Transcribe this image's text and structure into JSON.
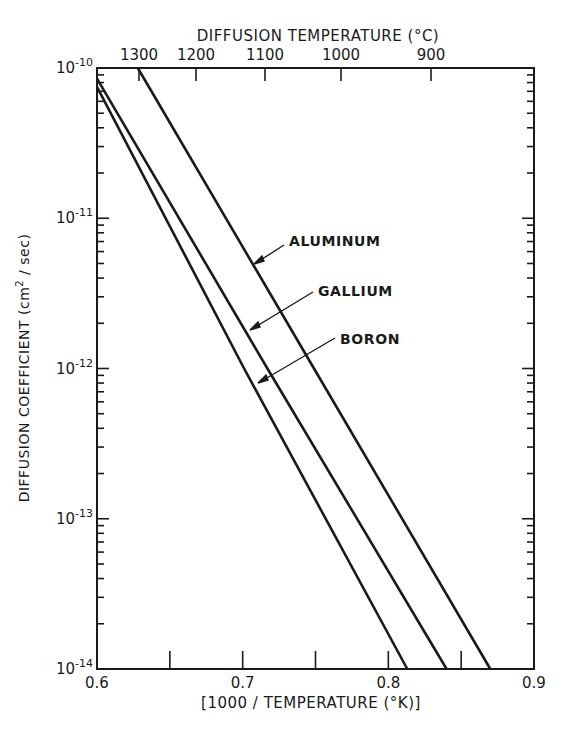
{
  "chart_data": {
    "type": "line",
    "title": "",
    "xlabel": "[1000 / TEMPERATURE (°K)]",
    "ylabel": "DIFFUSION COEFFICIENT (cm² / sec)",
    "top_xlabel": "DIFFUSION TEMPERATURE (°C)",
    "xlim": [
      0.6,
      0.9
    ],
    "ylim": [
      1e-14,
      1e-10
    ],
    "yscale": "log",
    "grid": false,
    "legend": "inline labels with arrows",
    "x_ticks": [
      {
        "value": 0.6,
        "label": "0.6"
      },
      {
        "value": 0.7,
        "label": "0.7"
      },
      {
        "value": 0.8,
        "label": "0.8"
      },
      {
        "value": 0.9,
        "label": "0.9"
      }
    ],
    "x_minor_ticks": [
      0.65,
      0.75,
      0.85
    ],
    "top_ticks": [
      {
        "label": "1300",
        "x_px": 139
      },
      {
        "label": "1200",
        "x_px": 196
      },
      {
        "label": "1100",
        "x_px": 265
      },
      {
        "label": "1000",
        "x_px": 341
      },
      {
        "label": "900",
        "x_px": 431
      }
    ],
    "y_ticks": [
      {
        "exp": -10,
        "base": "10",
        "sup": "-10"
      },
      {
        "exp": -11,
        "base": "10",
        "sup": "-11"
      },
      {
        "exp": -12,
        "base": "10",
        "sup": "-12"
      },
      {
        "exp": -13,
        "base": "10",
        "sup": "-13"
      },
      {
        "exp": -14,
        "base": "10",
        "sup": "-14"
      }
    ],
    "series": [
      {
        "name": "ALUMINUM",
        "x": [
          0.628,
          0.749,
          0.87
        ],
        "y": [
          1e-10,
          1e-12,
          1e-14
        ]
      },
      {
        "name": "GALLIUM",
        "x": [
          0.6,
          0.717,
          0.84
        ],
        "y": [
          8.5e-11,
          1e-12,
          1e-14
        ]
      },
      {
        "name": "BORON",
        "x": [
          0.6,
          0.701,
          0.813
        ],
        "y": [
          7.5e-11,
          1e-12,
          1e-14
        ]
      }
    ]
  },
  "labels": {
    "aluminum": "ALUMINUM",
    "gallium": "GALLIUM",
    "boron": "BORON",
    "top_axis_title": "DIFFUSION TEMPERATURE (°C)",
    "bottom_axis_title": "[1000 / TEMPERATURE (°K)]",
    "y_axis_title_main": "DIFFUSION COEFFICIENT (cm",
    "y_axis_title_sup": "2",
    "y_axis_title_end": " / sec)"
  }
}
